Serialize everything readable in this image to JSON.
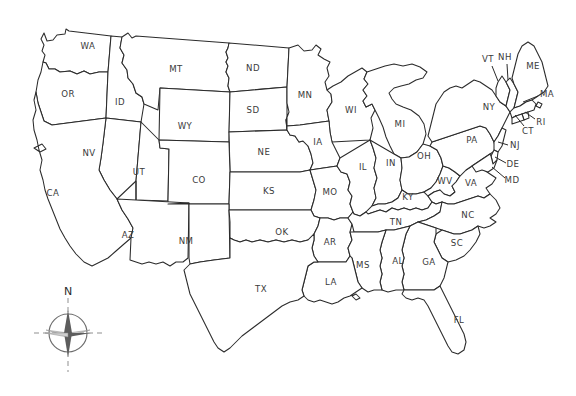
{
  "map": {
    "title": "United States outline map with state abbreviations",
    "projection_note": "contiguous 48 states, DC not shown",
    "stroke_color": "#2b2b2b",
    "fill_color": "#ffffff",
    "background_color": "#ffffff",
    "label_color": "#3a3a3a"
  },
  "compass": {
    "name": "compass-rose",
    "north_label": "N",
    "center_x": 68,
    "center_y": 333,
    "radius": 20
  },
  "states": [
    {
      "abbr": "WA",
      "name": "Washington",
      "x": 88,
      "y": 46,
      "leader": null
    },
    {
      "abbr": "OR",
      "name": "Oregon",
      "x": 68,
      "y": 94,
      "leader": null
    },
    {
      "abbr": "ID",
      "name": "Idaho",
      "x": 120,
      "y": 102,
      "leader": null
    },
    {
      "abbr": "MT",
      "name": "Montana",
      "x": 176,
      "y": 69,
      "leader": null
    },
    {
      "abbr": "ND",
      "name": "North Dakota",
      "x": 253,
      "y": 68,
      "leader": null
    },
    {
      "abbr": "SD",
      "name": "South Dakota",
      "x": 253,
      "y": 110,
      "leader": null
    },
    {
      "abbr": "MN",
      "name": "Minnesota",
      "x": 305,
      "y": 95,
      "leader": null
    },
    {
      "abbr": "WI",
      "name": "Wisconsin",
      "x": 351,
      "y": 110,
      "leader": null
    },
    {
      "abbr": "MI",
      "name": "Michigan",
      "x": 400,
      "y": 124,
      "leader": null
    },
    {
      "abbr": "WY",
      "name": "Wyoming",
      "x": 185,
      "y": 126,
      "leader": null
    },
    {
      "abbr": "NE",
      "name": "Nebraska",
      "x": 264,
      "y": 152,
      "leader": null
    },
    {
      "abbr": "IA",
      "name": "Iowa",
      "x": 318,
      "y": 142,
      "leader": null
    },
    {
      "abbr": "NV",
      "name": "Nevada",
      "x": 89,
      "y": 153,
      "leader": null
    },
    {
      "abbr": "UT",
      "name": "Utah",
      "x": 139,
      "y": 172,
      "leader": null
    },
    {
      "abbr": "CO",
      "name": "Colorado",
      "x": 199,
      "y": 180,
      "leader": null
    },
    {
      "abbr": "CA",
      "name": "California",
      "x": 53,
      "y": 193,
      "leader": null
    },
    {
      "abbr": "KS",
      "name": "Kansas",
      "x": 269,
      "y": 191,
      "leader": null
    },
    {
      "abbr": "MO",
      "name": "Missouri",
      "x": 330,
      "y": 192,
      "leader": null
    },
    {
      "abbr": "IL",
      "name": "Illinois",
      "x": 363,
      "y": 167,
      "leader": null
    },
    {
      "abbr": "IN",
      "name": "Indiana",
      "x": 391,
      "y": 163,
      "leader": null
    },
    {
      "abbr": "OH",
      "name": "Ohio",
      "x": 424,
      "y": 156,
      "leader": null
    },
    {
      "abbr": "KY",
      "name": "Kentucky",
      "x": 408,
      "y": 197,
      "leader": null
    },
    {
      "abbr": "WV",
      "name": "West Virginia",
      "x": 445,
      "y": 181,
      "leader": null
    },
    {
      "abbr": "VA",
      "name": "Virginia",
      "x": 471,
      "y": 183,
      "leader": null
    },
    {
      "abbr": "AZ",
      "name": "Arizona",
      "x": 128,
      "y": 235,
      "leader": null
    },
    {
      "abbr": "NM",
      "name": "New Mexico",
      "x": 186,
      "y": 241,
      "leader": null
    },
    {
      "abbr": "OK",
      "name": "Oklahoma",
      "x": 282,
      "y": 232,
      "leader": null
    },
    {
      "abbr": "AR",
      "name": "Arkansas",
      "x": 330,
      "y": 242,
      "leader": null
    },
    {
      "abbr": "TN",
      "name": "Tennessee",
      "x": 396,
      "y": 222,
      "leader": null
    },
    {
      "abbr": "NC",
      "name": "North Carolina",
      "x": 468,
      "y": 215,
      "leader": null
    },
    {
      "abbr": "SC",
      "name": "South Carolina",
      "x": 457,
      "y": 243,
      "leader": null
    },
    {
      "abbr": "TX",
      "name": "Texas",
      "x": 261,
      "y": 289,
      "leader": null
    },
    {
      "abbr": "LA",
      "name": "Louisiana",
      "x": 331,
      "y": 282,
      "leader": null
    },
    {
      "abbr": "MS",
      "name": "Mississippi",
      "x": 363,
      "y": 265,
      "leader": null
    },
    {
      "abbr": "AL",
      "name": "Alabama",
      "x": 398,
      "y": 261,
      "leader": null
    },
    {
      "abbr": "GA",
      "name": "Georgia",
      "x": 429,
      "y": 262,
      "leader": null
    },
    {
      "abbr": "FL",
      "name": "Florida",
      "x": 459,
      "y": 320,
      "leader": null
    },
    {
      "abbr": "PA",
      "name": "Pennsylvania",
      "x": 472,
      "y": 140,
      "leader": null
    },
    {
      "abbr": "NY",
      "name": "New York",
      "x": 489,
      "y": 107,
      "leader": null
    },
    {
      "abbr": "VT",
      "name": "Vermont",
      "x": 488,
      "y": 59,
      "leader": {
        "x1": 492,
        "y1": 66,
        "x2": 498,
        "y2": 81
      }
    },
    {
      "abbr": "NH",
      "name": "New Hampshire",
      "x": 505,
      "y": 57,
      "leader": {
        "x1": 507,
        "y1": 64,
        "x2": 508,
        "y2": 80
      }
    },
    {
      "abbr": "ME",
      "name": "Maine",
      "x": 533,
      "y": 66,
      "leader": null
    },
    {
      "abbr": "MA",
      "name": "Massachusetts",
      "x": 547,
      "y": 94,
      "leader": {
        "x1": 538,
        "y1": 96,
        "x2": 523,
        "y2": 102
      }
    },
    {
      "abbr": "RI",
      "name": "Rhode Island",
      "x": 541,
      "y": 122,
      "leader": {
        "x1": 535,
        "y1": 119,
        "x2": 525,
        "y2": 112
      }
    },
    {
      "abbr": "CT",
      "name": "Connecticut",
      "x": 528,
      "y": 131,
      "leader": {
        "x1": 524,
        "y1": 126,
        "x2": 515,
        "y2": 115
      }
    },
    {
      "abbr": "NJ",
      "name": "New Jersey",
      "x": 515,
      "y": 145,
      "leader": {
        "x1": 508,
        "y1": 145,
        "x2": 498,
        "y2": 142
      }
    },
    {
      "abbr": "DE",
      "name": "Delaware",
      "x": 513,
      "y": 164,
      "leader": {
        "x1": 506,
        "y1": 163,
        "x2": 495,
        "y2": 157
      }
    },
    {
      "abbr": "MD",
      "name": "Maryland",
      "x": 512,
      "y": 180,
      "leader": {
        "x1": 505,
        "y1": 178,
        "x2": 492,
        "y2": 167
      }
    }
  ]
}
